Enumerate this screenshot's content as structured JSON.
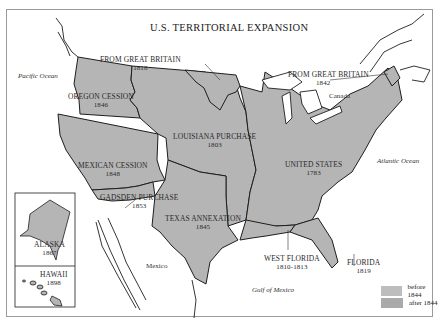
{
  "map": {
    "title": "U.S. TERRITORIAL EXPANSION",
    "colors": {
      "before_1844": "#b9b9b9",
      "after_1844": "#a8a8a8",
      "outline": "#1e1e1e",
      "water": "#ffffff"
    },
    "regions": [
      {
        "name": "OREGON CESSION",
        "year": "1846"
      },
      {
        "name": "FROM GREAT BRITAIN",
        "year": "1818"
      },
      {
        "name": "FROM GREAT BRITAIN",
        "year": "1842"
      },
      {
        "name": "LOUISIANA PURCHASE",
        "year": "1803"
      },
      {
        "name": "MEXICAN CESSION",
        "year": "1848"
      },
      {
        "name": "UNITED STATES",
        "year": "1783"
      },
      {
        "name": "GADSDEN PURCHASE",
        "year": "1853"
      },
      {
        "name": "TEXAS ANNEXATION",
        "year": "1845"
      },
      {
        "name": "WEST FLORIDA",
        "year": "1810-1813"
      },
      {
        "name": "FLORIDA",
        "year": "1819"
      },
      {
        "name": "ALASKA",
        "year": "1867"
      },
      {
        "name": "HAWAII",
        "year": "1898"
      }
    ],
    "places": {
      "pacific": "Pacific Ocean",
      "atlantic": "Atlantic Ocean",
      "gulf": "Gulf of Mexico",
      "canada": "Canada",
      "mexico": "Mexico"
    },
    "legend": [
      {
        "label": "before 1844",
        "color": "#b9b9b9"
      },
      {
        "label": "after 1844",
        "color": "#a8a8a8"
      }
    ]
  }
}
